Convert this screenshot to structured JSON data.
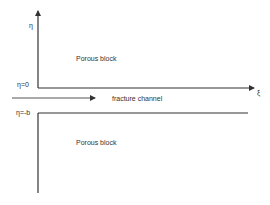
{
  "diagram": {
    "upper_region_label": "Porous block",
    "lower_region_label": "Porous block",
    "channel_label": "fracture channel",
    "eta_axis_label": "η",
    "xi_axis_label": "ξ",
    "eta_zero_label": "η=0",
    "eta_minus_b_label": "η=-b",
    "line_color": "#333333",
    "arrow_color": "#555555"
  }
}
